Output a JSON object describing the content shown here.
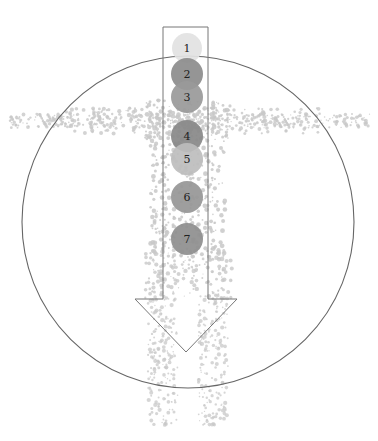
{
  "diagram": {
    "type": "chakra-body-diagram",
    "colors": {
      "background": "#ffffff",
      "outline": "#666666",
      "body_dots": "#c8c8c8",
      "arrow_stroke": "#777777"
    },
    "outer_circle": {
      "cx": 188,
      "cy": 222,
      "r": 166
    },
    "arrow": {
      "shaft_left": 163,
      "shaft_right": 208,
      "top": 27,
      "shaft_bottom": 299,
      "head_left": 135,
      "head_right": 237,
      "tip_x": 186,
      "tip_y": 352
    },
    "nodes": [
      {
        "label": "1",
        "cx": 187,
        "cy": 48,
        "r": 15,
        "color": "#e2e2e2"
      },
      {
        "label": "2",
        "cx": 187,
        "cy": 74,
        "r": 16,
        "color": "#8c8c8c"
      },
      {
        "label": "3",
        "cx": 187,
        "cy": 97,
        "r": 16,
        "color": "#999999"
      },
      {
        "label": "4",
        "cx": 187,
        "cy": 136,
        "r": 16,
        "color": "#888888"
      },
      {
        "label": "5",
        "cx": 187,
        "cy": 159,
        "r": 16,
        "color": "#bdbdbd"
      },
      {
        "label": "6",
        "cx": 187,
        "cy": 197,
        "r": 16,
        "color": "#969696"
      },
      {
        "label": "7",
        "cx": 187,
        "cy": 239,
        "r": 16,
        "color": "#8e8e8e"
      }
    ]
  }
}
